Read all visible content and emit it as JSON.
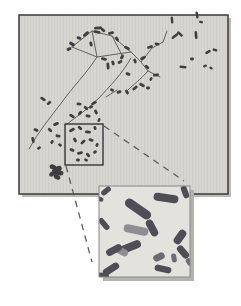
{
  "figure": {
    "kind": "micrograph-with-inset",
    "colors": {
      "page_bg": "#ffffff",
      "panel_bg": "#d8d6d1",
      "panel_border": "#3a3a38",
      "panel_shadow": "#bdbbb8",
      "texture_line": "rgba(0,0,0,0.045)",
      "thread": "#55544f",
      "chromosome_main": "#3f3e40",
      "box_border": "#1c1c1c",
      "dash_line": "#5c5c5c",
      "inset_bg": "#e4e2dd",
      "inset_border": "#8a8886",
      "inset_shadow": "#b4b2af",
      "chrom_dark": "#504e55",
      "chrom_mid": "#6e6b73",
      "chrom_light": "#8f8c94"
    },
    "canvas": {
      "w": 241,
      "h": 306
    },
    "panel": {
      "x": 19,
      "y": 15,
      "w": 209,
      "h": 179
    },
    "selection_box": {
      "x": 65,
      "y": 124,
      "w": 38,
      "h": 41
    },
    "callout_lines": [
      {
        "x1": 66,
        "y1": 166,
        "x2": 92,
        "y2": 262
      },
      {
        "x1": 104,
        "y1": 126,
        "x2": 184,
        "y2": 181
      }
    ],
    "inset": {
      "x": 99,
      "y": 186,
      "w": 91,
      "h": 91
    },
    "threads": [
      "M72,47 L92,31 L112,36 L131,52",
      "M72,47 L97,57 L131,52",
      "M92,31 L97,57",
      "M112,36 L123,57",
      "M131,52 L141,62 L152,48 L163,42",
      "M141,62 L148,71 L160,77",
      "M163,42 L167,31",
      "M97,57 C86,74 72,88 62,102 C50,118 38,132 29,149",
      "M131,58 C122,74 110,86 98,99 C88,109 76,117 67,124",
      "M148,71 C140,80 134,84 128,90",
      "M106,97 L117,90"
    ],
    "chromosomes_main": [
      [
        98,
        28,
        8,
        2.8,
        -5
      ],
      [
        97,
        32,
        7,
        2.8,
        8
      ],
      [
        103,
        30,
        5,
        2.8,
        40
      ],
      [
        86,
        34,
        7,
        3,
        -40
      ],
      [
        79,
        38,
        5,
        2.8,
        20
      ],
      [
        72,
        44,
        6,
        3.4,
        30
      ],
      [
        69,
        49,
        5,
        3,
        -25
      ],
      [
        91,
        44,
        5,
        2.8,
        75
      ],
      [
        111,
        33,
        6,
        2.8,
        -12
      ],
      [
        117,
        39,
        5,
        2.8,
        55
      ],
      [
        127,
        48,
        6,
        2.8,
        25
      ],
      [
        122,
        57,
        5,
        2.8,
        -60
      ],
      [
        104,
        59,
        6,
        2.8,
        12
      ],
      [
        135,
        61,
        5,
        2.8,
        70
      ],
      [
        143,
        58,
        6,
        2.8,
        -28
      ],
      [
        150,
        47,
        6,
        2.8,
        -18
      ],
      [
        157,
        44,
        5,
        2.6,
        12
      ],
      [
        147,
        67,
        5,
        2.8,
        42
      ],
      [
        156,
        75,
        6,
        2.8,
        -8
      ],
      [
        172,
        20,
        7,
        2.4,
        85
      ],
      [
        197,
        15,
        7,
        2.4,
        80
      ],
      [
        201,
        22,
        4,
        2.4,
        15
      ],
      [
        175,
        36,
        8,
        2.4,
        -38
      ],
      [
        180,
        34,
        7,
        2.4,
        42
      ],
      [
        196,
        35,
        8,
        2.6,
        85
      ],
      [
        208,
        52,
        6,
        2.6,
        -30
      ],
      [
        215,
        50,
        5,
        2.4,
        20
      ],
      [
        192,
        59,
        4,
        2.8,
        0
      ],
      [
        183,
        67,
        7,
        2.4,
        5
      ],
      [
        205,
        66,
        4,
        2.4,
        -20
      ],
      [
        211,
        68,
        3.5,
        2.4,
        35
      ],
      [
        108,
        66,
        7,
        2.8,
        85
      ],
      [
        113,
        63,
        5,
        2.8,
        70
      ],
      [
        120,
        62,
        5,
        2.8,
        -30
      ],
      [
        128,
        74,
        5,
        2.8,
        20
      ],
      [
        135,
        88,
        6,
        2.8,
        -40
      ],
      [
        142,
        85,
        6,
        2.8,
        30
      ],
      [
        148,
        88,
        4,
        2.8,
        0
      ],
      [
        127,
        92,
        5,
        2.8,
        62
      ],
      [
        119,
        92,
        5,
        2.8,
        -20
      ],
      [
        112,
        90,
        4,
        2.8,
        25
      ],
      [
        151,
        79,
        4,
        2.4,
        -60
      ],
      [
        94,
        103,
        6,
        2.8,
        -32
      ],
      [
        86,
        108,
        5,
        2.8,
        42
      ],
      [
        79,
        104,
        5,
        2.8,
        2
      ],
      [
        43,
        99,
        6,
        2.8,
        32
      ],
      [
        49,
        103,
        5,
        2.8,
        -40
      ],
      [
        36,
        130,
        5,
        2.8,
        22
      ],
      [
        33,
        140,
        6,
        2.8,
        78
      ],
      [
        39,
        148,
        4,
        2.6,
        -30
      ],
      [
        72,
        116,
        6,
        2.8,
        32
      ],
      [
        80,
        113,
        5,
        2.8,
        -52
      ],
      [
        88,
        116,
        5,
        2.8,
        12
      ],
      [
        96,
        112,
        5,
        2.8,
        62
      ],
      [
        91,
        107,
        4,
        2.8,
        -20
      ],
      [
        99,
        120,
        4,
        2.6,
        -70
      ],
      [
        72,
        130,
        6,
        2.8,
        -30
      ],
      [
        80,
        128,
        5,
        2.8,
        45
      ],
      [
        88,
        132,
        6,
        2.8,
        2
      ],
      [
        95,
        128,
        4,
        2.8,
        72
      ],
      [
        75,
        140,
        5,
        2.8,
        60
      ],
      [
        83,
        142,
        6,
        2.8,
        -45
      ],
      [
        91,
        140,
        5,
        2.8,
        15
      ],
      [
        97,
        145,
        4,
        2.8,
        -70
      ],
      [
        72,
        150,
        5,
        2.8,
        22
      ],
      [
        80,
        153,
        6,
        2.8,
        -15
      ],
      [
        88,
        155,
        5,
        2.8,
        52
      ],
      [
        95,
        152,
        4,
        2.8,
        -40
      ],
      [
        78,
        160,
        4,
        2.8,
        2
      ],
      [
        86,
        160,
        4,
        2.6,
        32
      ],
      [
        56,
        124,
        6,
        2.8,
        -22
      ],
      [
        50,
        130,
        5,
        2.8,
        42
      ],
      [
        58,
        136,
        5,
        2.8,
        12
      ],
      [
        52,
        142,
        4,
        2.8,
        -60
      ],
      [
        60,
        145,
        4,
        2.8,
        32
      ]
    ],
    "cluster_blob": [
      [
        53,
        167,
        3.5,
        2.5,
        20
      ],
      [
        58,
        169,
        4,
        2.8,
        -30
      ],
      [
        55,
        172,
        3.5,
        2.5,
        60
      ],
      [
        60,
        173,
        3.5,
        2.5,
        10
      ],
      [
        52,
        174,
        3,
        2.2,
        -40
      ],
      [
        57,
        177,
        3.5,
        2.4,
        30
      ]
    ],
    "chromosomes_inset": [
      [
        106,
        191,
        11,
        5.5,
        -40,
        "dark"
      ],
      [
        100,
        199,
        7,
        4.5,
        25,
        "dark"
      ],
      [
        104,
        224,
        14,
        5.5,
        50,
        "dark"
      ],
      [
        138,
        209,
        30,
        9,
        35,
        "dark"
      ],
      [
        166,
        198,
        25,
        8,
        8,
        "dark"
      ],
      [
        185,
        192,
        13,
        6,
        70,
        "dark"
      ],
      [
        152,
        228,
        18,
        7.5,
        62,
        "dark"
      ],
      [
        136,
        230,
        25,
        8,
        12,
        "light"
      ],
      [
        130,
        247,
        23,
        8,
        -22,
        "dark"
      ],
      [
        121,
        251,
        15,
        7,
        28,
        "light"
      ],
      [
        114,
        250,
        17,
        7,
        -28,
        "dark"
      ],
      [
        111,
        269,
        18,
        7,
        -32,
        "dark"
      ],
      [
        103,
        276,
        12,
        6,
        8,
        "dark"
      ],
      [
        159,
        257,
        12,
        7,
        -25,
        "mid"
      ],
      [
        180,
        237,
        16,
        8,
        -55,
        "dark"
      ],
      [
        183,
        252,
        15,
        7,
        50,
        "dark"
      ],
      [
        174,
        258,
        9,
        5,
        80,
        "mid"
      ],
      [
        163,
        269,
        17,
        6.5,
        12,
        "dark"
      ],
      [
        189,
        262,
        8,
        5,
        60,
        "mid"
      ]
    ]
  }
}
